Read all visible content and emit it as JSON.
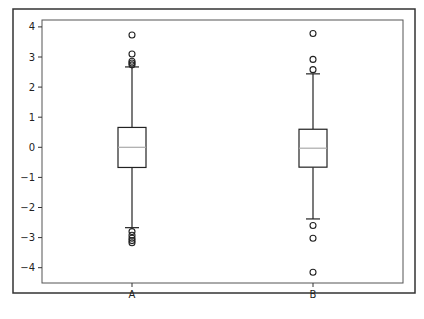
{
  "chart_data": {
    "type": "box",
    "title": "",
    "xlabel": "",
    "ylabel": "",
    "categories": [
      "A",
      "B"
    ],
    "ylim": [
      -4.5,
      4.2
    ],
    "yticks": [
      -4,
      -3,
      -2,
      -1,
      0,
      1,
      2,
      3,
      4
    ],
    "ytick_labels": [
      "−4",
      "−3",
      "−2",
      "−1",
      "0",
      "1",
      "2",
      "3",
      "4"
    ],
    "grid": false,
    "legend": null,
    "series": [
      {
        "name": "A",
        "q1": -0.67,
        "median": 0.0,
        "q3": 0.66,
        "whisker_low": -2.67,
        "whisker_high": 2.67,
        "outliers": [
          3.73,
          3.1,
          2.86,
          2.8,
          2.74,
          -2.8,
          -2.92,
          -3.02,
          -3.1,
          -3.17
        ]
      },
      {
        "name": "B",
        "q1": -0.66,
        "median": -0.03,
        "q3": 0.6,
        "whisker_low": -2.38,
        "whisker_high": 2.44,
        "outliers": [
          3.78,
          2.92,
          2.58,
          -2.6,
          -3.02,
          -4.15
        ]
      }
    ],
    "colors": {
      "box": "#222222",
      "median": "#aaaaaa",
      "frame": "#333333",
      "axes": "#555555"
    }
  }
}
